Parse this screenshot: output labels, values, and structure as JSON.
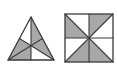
{
  "canvas": {
    "width": 117,
    "height": 75,
    "background_color": "#ffffff"
  },
  "style": {
    "shaded_fill": "#a8a8a8",
    "unshaded_fill": "#ffffff",
    "stroke_color": "#3a3a3a",
    "stroke_width": 1.1
  },
  "figures": [
    {
      "name": "triangle-with-medians",
      "label": "",
      "shape": "triangle",
      "description": "Isosceles triangle subdivided by three medians meeting at the centroid, producing six small triangles with alternating shading",
      "vertices": [
        {
          "name": "apex",
          "x": 31,
          "y": 17
        },
        {
          "name": "bottom-left",
          "x": 8,
          "y": 60
        },
        {
          "name": "bottom-right",
          "x": 54,
          "y": 60
        }
      ],
      "midpoints": [
        {
          "name": "midpoint-left-side",
          "x": 19.5,
          "y": 38.5
        },
        {
          "name": "midpoint-right-side",
          "x": 42.5,
          "y": 38.5
        },
        {
          "name": "midpoint-base",
          "x": 31,
          "y": 60
        }
      ],
      "centroid": {
        "x": 31,
        "y": 45.67
      },
      "regions": [
        {
          "id": "t1",
          "points": "31,17 19.5,38.5 31,45.67",
          "shaded": false
        },
        {
          "id": "t2",
          "points": "31,17 42.5,38.5 31,45.67",
          "shaded": true
        },
        {
          "id": "t3",
          "points": "19.5,38.5 8,60 31,45.67",
          "shaded": true
        },
        {
          "id": "t4",
          "points": "42.5,38.5 54,60 31,45.67",
          "shaded": true
        },
        {
          "id": "t5",
          "points": "8,60 31,60 31,45.67",
          "shaded": true
        },
        {
          "id": "t6",
          "points": "31,60 54,60 31,45.67",
          "shaded": false
        }
      ],
      "shaded_count": 4,
      "total_regions": 6
    },
    {
      "name": "square-pinwheel",
      "label": "",
      "shape": "square",
      "description": "Square divided into four quadrants, each quadrant split by a diagonal into two triangles, shaded in a pinwheel pattern",
      "bounds": {
        "x": 3,
        "y": 14,
        "width": 48,
        "height": 48
      },
      "center": {
        "x": 27,
        "y": 38
      },
      "regions": [
        {
          "id": "q1a",
          "quadrant": "top-left",
          "points": "3,14 27,38 3,38",
          "shaded": true
        },
        {
          "id": "q1b",
          "quadrant": "top-left",
          "points": "3,14 27,14 27,38",
          "shaded": false
        },
        {
          "id": "q2a",
          "quadrant": "top-right",
          "points": "27,14 51,14 27,38",
          "shaded": true
        },
        {
          "id": "q2b",
          "quadrant": "top-right",
          "points": "51,14 51,38 27,38",
          "shaded": false
        },
        {
          "id": "q3a",
          "quadrant": "bottom-left",
          "points": "3,38 27,38 3,62",
          "shaded": false
        },
        {
          "id": "q3b",
          "quadrant": "bottom-left",
          "points": "27,38 27,62 3,62",
          "shaded": true
        },
        {
          "id": "q4a",
          "quadrant": "bottom-right",
          "points": "27,38 51,62 27,62",
          "shaded": true
        },
        {
          "id": "q4b",
          "quadrant": "bottom-right",
          "points": "27,38 51,38 51,62",
          "shaded": false
        }
      ],
      "shaded_count": 4,
      "total_regions": 8
    }
  ]
}
